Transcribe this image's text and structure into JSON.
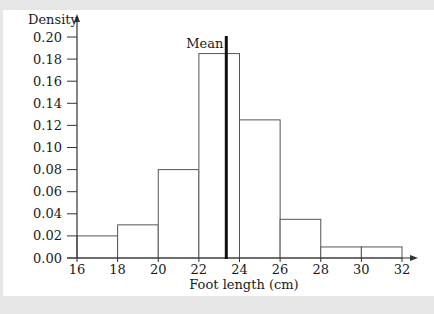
{
  "chart_data": {
    "type": "bar",
    "subtype": "histogram",
    "title": "",
    "xlabel": "Foot length (cm)",
    "ylabel": "Density",
    "bins": [
      [
        16,
        18
      ],
      [
        18,
        20
      ],
      [
        20,
        22
      ],
      [
        22,
        24
      ],
      [
        24,
        26
      ],
      [
        26,
        28
      ],
      [
        28,
        30
      ],
      [
        30,
        32
      ]
    ],
    "categories": [
      "16-18",
      "18-20",
      "20-22",
      "22-24",
      "24-26",
      "26-28",
      "28-30",
      "30-32"
    ],
    "values": [
      0.02,
      0.03,
      0.08,
      0.185,
      0.125,
      0.035,
      0.01,
      0.01
    ],
    "xticks": [
      "16",
      "18",
      "20",
      "22",
      "24",
      "26",
      "28",
      "30",
      "32"
    ],
    "yticks": [
      "0.00",
      "0.02",
      "0.04",
      "0.06",
      "0.08",
      "0.10",
      "0.12",
      "0.14",
      "0.16",
      "0.18",
      "0.20"
    ],
    "xlim": [
      16,
      32
    ],
    "ylim": [
      0,
      0.2
    ],
    "grid": false,
    "annotations": [
      {
        "label": "Mean",
        "x": 23.35,
        "style": "thick vertical line"
      }
    ]
  }
}
